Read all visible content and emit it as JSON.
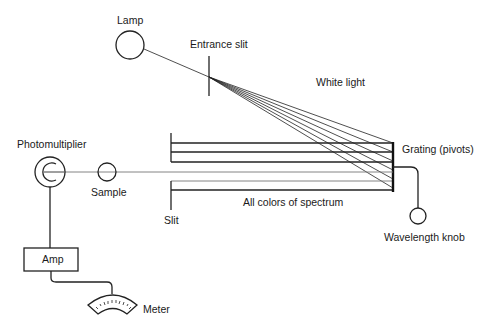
{
  "diagram": {
    "labels": {
      "lamp": "Lamp",
      "entrance_slit": "Entrance slit",
      "white_light": "White light",
      "grating": "Grating (pivots)",
      "photomultiplier": "Photomultiplier",
      "sample": "Sample",
      "spectrum": "All colors of spectrum",
      "slit": "Slit",
      "wavelength_knob": "Wavelength knob",
      "amp": "Amp",
      "meter": "Meter"
    },
    "components": [
      {
        "id": "lamp",
        "shape": "circle"
      },
      {
        "id": "entrance-slit",
        "shape": "vertical-line"
      },
      {
        "id": "grating",
        "shape": "thick-vertical-bar"
      },
      {
        "id": "exit-slit",
        "shape": "vertical-line"
      },
      {
        "id": "sample",
        "shape": "circle"
      },
      {
        "id": "photomultiplier",
        "shape": "double-circle"
      },
      {
        "id": "amp",
        "shape": "rectangle"
      },
      {
        "id": "meter",
        "shape": "arc-dial"
      },
      {
        "id": "wavelength-knob",
        "shape": "circle"
      }
    ],
    "colors": {
      "line": "#222222",
      "light_path": "#777777",
      "background": "#ffffff"
    }
  }
}
